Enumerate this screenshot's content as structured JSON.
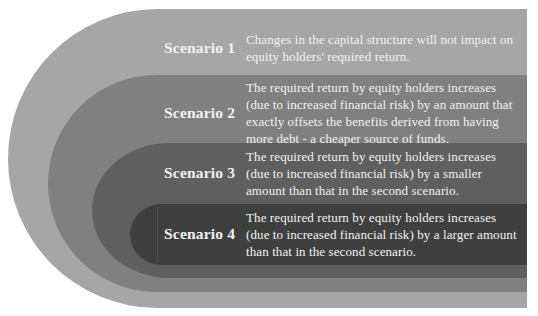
{
  "diagram": {
    "type": "nested-bands",
    "colors": {
      "band_1": "#a6a6a6",
      "band_2": "#808080",
      "band_3": "#5f5f5f",
      "band_4": "#3f3f3f",
      "text": "#f2f2f2"
    },
    "scenarios": [
      {
        "label": "Scenario 1",
        "description": "Changes in the capital structure will not impact on equity holders' required return."
      },
      {
        "label": "Scenario 2",
        "description": "The required return by equity holders increases (due to increased financial risk) by an amount that exactly offsets the benefits derived from having more debt - a cheaper source of funds."
      },
      {
        "label": "Scenario 3",
        "description": "The required return by equity holders increases (due to increased financial risk) by a smaller amount than that in the second scenario."
      },
      {
        "label": "Scenario 4",
        "description": "The required return by equity holders increases (due to increased financial risk) by a larger amount than that in the second scenario."
      }
    ]
  }
}
